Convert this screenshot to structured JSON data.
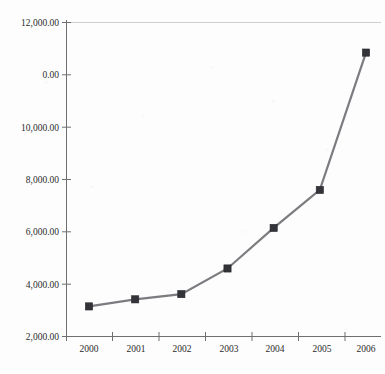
{
  "chart_data": {
    "type": "line",
    "title": "",
    "subtitle": "",
    "xlabel": "",
    "ylabel": "",
    "categories": [
      "2000",
      "2001",
      "2002",
      "2003",
      "2004",
      "2005",
      "2006"
    ],
    "x": [
      2000,
      2001,
      2002,
      2003,
      2004,
      2005,
      2006
    ],
    "series": [
      {
        "name": "",
        "values": [
          1150,
          1420,
          1620,
          2600,
          4150,
          5600,
          10850
        ],
        "line_color": "#7c7c80",
        "marker_color": "#33333a",
        "marker_shape": "square"
      }
    ],
    "ylim": [
      0,
      12000
    ],
    "ytick_values": [
      0,
      2000,
      4000,
      6000,
      8000,
      10000,
      12000
    ],
    "ytick_labels": [
      "0.00",
      "2,000.00",
      "4,000.00",
      "6,000.00",
      "8,000.00",
      "10,000.00",
      "12,000.00"
    ],
    "xtick_labels": [
      "2000",
      "2001",
      "2002",
      "2003",
      "2004",
      "2005",
      "2006"
    ],
    "grid": "top-border-only",
    "legend": "none",
    "legend_position": "none",
    "background_color": "#fdfdfd",
    "axis_color": "#6f6f72",
    "gridline_color": "#cfcfd3",
    "text_color": "#2b2b2b"
  }
}
